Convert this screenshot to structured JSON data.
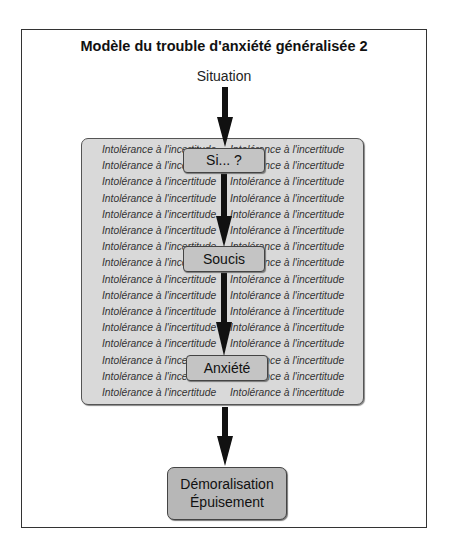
{
  "title": "Modèle du trouble d'anxiété généralisée 2",
  "situation_label": "Situation",
  "background_box": {
    "repeated_text": "Intolérance à l'incertitude",
    "rows": 16,
    "columns": 2
  },
  "nodes": {
    "si": "Si... ?",
    "soucis": "Soucis",
    "anxiete": "Anxiété",
    "final_line1": "Démoralisation",
    "final_line2": "Épuisement"
  },
  "colors": {
    "background_box": "#d9d9d9",
    "node_fill": "#c4c4c4",
    "final_node_fill": "#b7b7b7",
    "arrow": "#111111"
  }
}
